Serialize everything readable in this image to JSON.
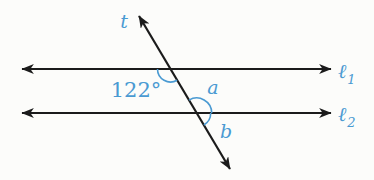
{
  "diagram": {
    "labels": {
      "transversal": "t",
      "angle_122": "122°",
      "angle_a": "a",
      "angle_b": "b",
      "line1": {
        "symbol": "ℓ",
        "subscript": "1"
      },
      "line2": {
        "symbol": "ℓ",
        "subscript": "2"
      }
    },
    "colors": {
      "label_blue": "#4a9ad2",
      "line_black": "#1b1b1b",
      "background": "#fcfcfa"
    }
  }
}
